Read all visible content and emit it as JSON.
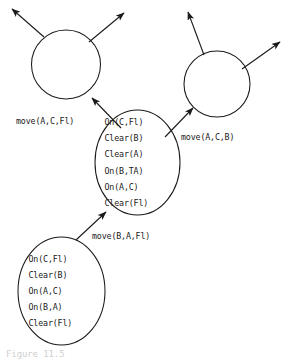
{
  "figure": {
    "kind": "search-tree-diagram",
    "domain_note": "blocks-world planning search tree",
    "background_color": "#ffffff",
    "line_color": "#1a1a1a",
    "caption_partial": "Figure 11.5"
  },
  "nodes": [
    {
      "id": "node-initial-state",
      "shape": "ellipse",
      "name": "initial-state-node",
      "cx": 61.5,
      "cy": 291,
      "rx": 43.5,
      "ry": 54,
      "literals": [
        "On(C,Fl)",
        "Clear(B)",
        "On(A,C)",
        "On(B,A)",
        "Clear(Fl)"
      ]
    },
    {
      "id": "node-successor-state",
      "shape": "ellipse",
      "name": "successor-state-node",
      "cx": 137.5,
      "cy": 162.5,
      "rx": 42.5,
      "ry": 52.5,
      "literals": [
        "On(C,Fl)",
        "Clear(B)",
        "Clear(A)",
        "On(B,TA)",
        "On(A,C)",
        "Clear(Fl)"
      ]
    },
    {
      "id": "node-left-expanded",
      "shape": "circle",
      "name": "left-expanded-node",
      "cx": 66,
      "cy": 64.5,
      "r": 34.5,
      "literals": []
    },
    {
      "id": "node-right-expanded",
      "shape": "circle",
      "name": "right-expanded-node",
      "cx": 217,
      "cy": 84,
      "r": 33,
      "literals": []
    }
  ],
  "edges": [
    {
      "id": "edge-move-b-a-fl",
      "name": "edge-initial-to-successor",
      "label": "move(B,A,Fl)",
      "label_x": 92,
      "label_y": 239,
      "x1": 76,
      "y1": 240,
      "x2": 106,
      "y2": 212
    },
    {
      "id": "edge-move-a-c-fl",
      "name": "edge-successor-to-left",
      "label": "move(A,C,Fl)",
      "label_x": 16,
      "label_y": 124,
      "x1": 121,
      "y1": 128,
      "x2": 92,
      "y2": 98
    },
    {
      "id": "edge-move-a-c-b",
      "name": "edge-successor-to-right",
      "label": "move(A,C,B)",
      "label_x": 181,
      "label_y": 140,
      "x1": 165,
      "y1": 137,
      "x2": 193,
      "y2": 108
    },
    {
      "id": "edge-left-out-1",
      "name": "left-node-outgoing-edge-left",
      "label": "",
      "x1": 44,
      "y1": 37,
      "x2": 12,
      "y2": 9
    },
    {
      "id": "edge-left-out-2",
      "name": "left-node-outgoing-edge-right",
      "label": "",
      "x1": 89,
      "y1": 42,
      "x2": 124,
      "y2": 13
    },
    {
      "id": "edge-right-out-1",
      "name": "right-node-outgoing-edge-left",
      "label": "",
      "x1": 204,
      "y1": 55,
      "x2": 188,
      "y2": 12
    },
    {
      "id": "edge-right-out-2",
      "name": "right-node-outgoing-edge-right",
      "label": "",
      "x1": 242,
      "y1": 69,
      "x2": 280,
      "y2": 42
    }
  ]
}
